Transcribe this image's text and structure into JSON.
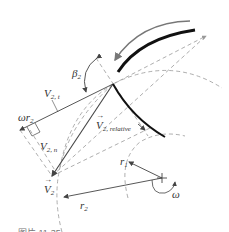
{
  "diagram": {
    "labels": {
      "beta2": "β",
      "beta2_sub": "2",
      "v2t": "V",
      "v2t_sub": "2, t",
      "omega_r2": "ωr",
      "omega_r2_sub": "2",
      "v2n": "V",
      "v2n_sub": "2, n",
      "v2rel": "V",
      "v2rel_sub": "2, relative",
      "v2": "V",
      "v2_sub": "2",
      "r1": "r",
      "r1_sub": "1",
      "r2": "r",
      "r2_sub": "2",
      "omega": "ω"
    },
    "caption": "图片 11-35",
    "colors": {
      "line": "#444444",
      "dashed": "#999999",
      "blade": "#111111",
      "arrow_gray": "#777777"
    }
  }
}
